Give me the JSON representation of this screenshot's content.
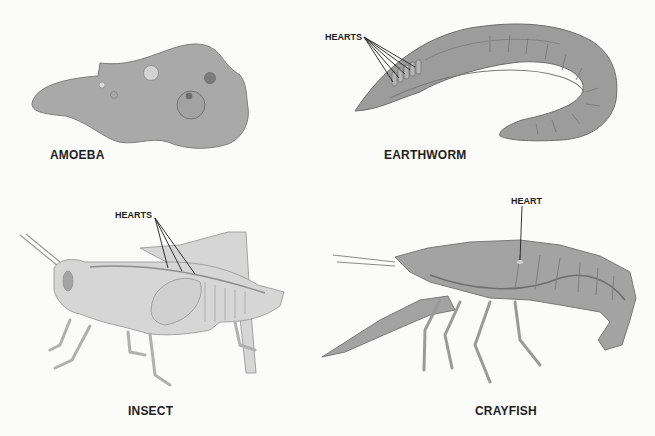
{
  "figure": {
    "panels": [
      {
        "id": "amoeba",
        "label": "AMOEBA",
        "callout": null
      },
      {
        "id": "earthworm",
        "label": "EARTHWORM",
        "callout": "HEARTS"
      },
      {
        "id": "insect",
        "label": "INSECT",
        "callout": "HEARTS"
      },
      {
        "id": "crayfish",
        "label": "CRAYFISH",
        "callout": "HEART"
      }
    ]
  },
  "colors": {
    "background": "#fbfbf9",
    "amoeba_fill": "#a9a9a9",
    "worm_fill": "#9c9c9c",
    "insect_fill": "#d6d6d6",
    "crayfish_fill": "#a3a3a3",
    "outline": "#6f6f6f",
    "text": "#1e1e1e"
  }
}
